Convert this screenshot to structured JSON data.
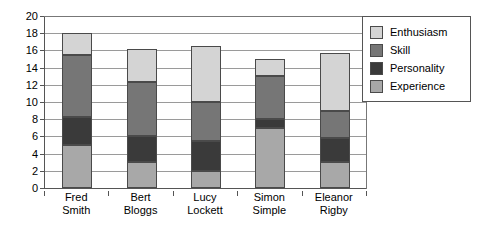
{
  "chart_data": {
    "type": "bar",
    "stacked": true,
    "title": "",
    "xlabel": "",
    "ylabel": "",
    "ylim": [
      0,
      20
    ],
    "ytick_step": 2,
    "yticks": [
      0,
      2,
      4,
      6,
      8,
      10,
      12,
      14,
      16,
      18,
      20
    ],
    "grid": true,
    "legend_position": "right",
    "categories": [
      "Fred Smith",
      "Bert Bloggs",
      "Lucy Lockett",
      "Simon Simple",
      "Eleanor Rigby"
    ],
    "category_lines": [
      [
        "Fred",
        "Smith"
      ],
      [
        "Bert",
        "Bloggs"
      ],
      [
        "Lucy",
        "Lockett"
      ],
      [
        "Simon",
        "Simple"
      ],
      [
        "Eleanor",
        "Rigby"
      ]
    ],
    "stack_order_bottom_to_top": [
      "Experience",
      "Personality",
      "Skill",
      "Enthusiasm"
    ],
    "series": [
      {
        "name": "Experience",
        "color": "#a8a8a8",
        "values": [
          5.0,
          3.0,
          2.0,
          7.0,
          3.0
        ]
      },
      {
        "name": "Personality",
        "color": "#3a3a3a",
        "values": [
          3.2,
          3.0,
          3.5,
          1.0,
          2.8
        ]
      },
      {
        "name": "Skill",
        "color": "#767676",
        "values": [
          7.3,
          6.3,
          4.5,
          5.0,
          3.2
        ]
      },
      {
        "name": "Enthusiasm",
        "color": "#d4d4d4",
        "values": [
          2.5,
          3.9,
          6.5,
          2.0,
          6.7
        ]
      }
    ],
    "totals": [
      18.0,
      16.2,
      16.5,
      15.0,
      15.7
    ]
  },
  "legend": {
    "items": [
      {
        "label": "Enthusiasm",
        "color": "#d4d4d4"
      },
      {
        "label": "Skill",
        "color": "#767676"
      },
      {
        "label": "Personality",
        "color": "#3a3a3a"
      },
      {
        "label": "Experience",
        "color": "#a8a8a8"
      }
    ]
  },
  "colors": {
    "axis": "#555555",
    "gridline": "#9a9a9a",
    "segment_border": "#4a4a4a",
    "background": "#ffffff",
    "text": "#000000"
  }
}
